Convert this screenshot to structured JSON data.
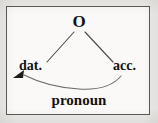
{
  "figure": {
    "type": "linguistic-case-diagram",
    "background_color": "#faf9f7",
    "page_color": "#eceae7",
    "frame_color": "#5a5a58",
    "ink_color": "#121212",
    "line_color": "#4a4a48",
    "nodes": {
      "top": "O",
      "left": "dat.",
      "right": "acc.",
      "arc": "pronoun"
    },
    "edges": [
      {
        "name": "o-to-dat",
        "from": "O",
        "to": "dat.",
        "style": "straight"
      },
      {
        "name": "o-to-acc",
        "from": "O",
        "to": "acc.",
        "style": "straight"
      },
      {
        "name": "acc-to-dat",
        "from": "acc.",
        "to": "dat.",
        "style": "curved-arrow",
        "label": "pronoun"
      }
    ],
    "arrowhead": {
      "target": "dat.",
      "direction": "down-left"
    }
  }
}
